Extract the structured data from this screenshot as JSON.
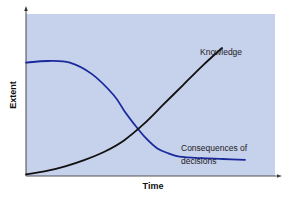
{
  "chart_data": {
    "type": "line",
    "title": "",
    "xlabel": "Time",
    "ylabel": "Extent",
    "xlim": [
      0,
      100
    ],
    "ylim": [
      0,
      100
    ],
    "grid": false,
    "x_ticks": [],
    "y_ticks": [],
    "legend": "none (direct line labels)",
    "plot_background": "#c6d1ec",
    "series": [
      {
        "name": "Consequences of decisions",
        "label_lines": [
          "Consequences of",
          "decisions"
        ],
        "color": "#1a2a9c",
        "x": [
          0,
          10,
          20,
          30,
          40,
          45,
          50,
          55,
          60,
          65,
          70,
          80,
          90,
          100
        ],
        "y": [
          70,
          71,
          70,
          63,
          50,
          40,
          31,
          23,
          17,
          14,
          12,
          11,
          10.5,
          10
        ]
      },
      {
        "name": "Knowledge",
        "label_lines": [
          "Knowledge"
        ],
        "color": "#111111",
        "x": [
          0,
          10,
          20,
          30,
          40,
          50,
          60,
          70,
          80,
          90,
          100
        ],
        "y": [
          1,
          3,
          6,
          10,
          15,
          22,
          32,
          44,
          56,
          68,
          79
        ]
      }
    ]
  }
}
